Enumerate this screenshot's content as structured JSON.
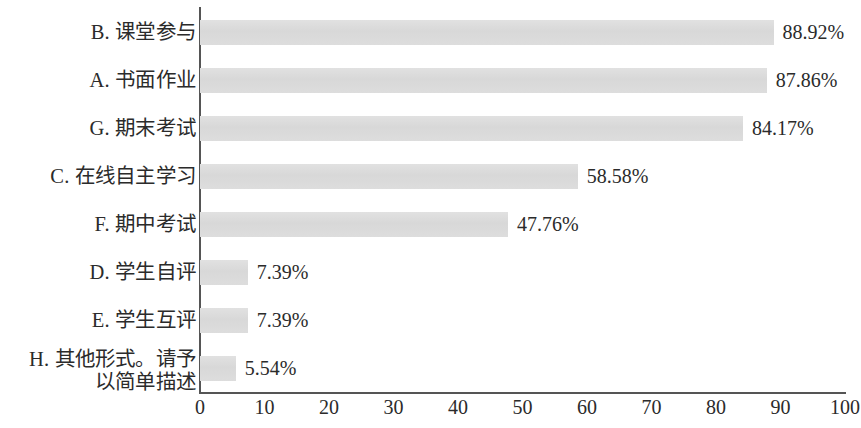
{
  "chart_data": {
    "type": "bar",
    "orientation": "horizontal",
    "title": "",
    "subtitle": "",
    "xlabel": "",
    "ylabel": "",
    "xlim": [
      0,
      100
    ],
    "xticks": [
      0,
      10,
      20,
      30,
      40,
      50,
      60,
      70,
      80,
      90,
      100
    ],
    "xtick_labels": [
      "0",
      "10",
      "20",
      "30",
      "40",
      "50",
      "60",
      "70",
      "80",
      "90",
      "100"
    ],
    "grid": false,
    "legend": false,
    "legend_position": "none",
    "bar_color": "#dcdcdc",
    "axis_color": "#555555",
    "text_color": "#2b2b2b",
    "value_label_suffix": "%",
    "categories": [
      "B. 课堂参与",
      "A. 书面作业",
      "G. 期末考试",
      "C. 在线自主学习",
      "F. 期中考试",
      "D. 学生自评",
      "E. 学生互评",
      "H. 其他形式。请予以简单描述"
    ],
    "values": [
      88.92,
      87.86,
      84.17,
      58.58,
      47.76,
      7.39,
      7.39,
      5.54
    ],
    "value_labels": [
      "88.92%",
      "87.86%",
      "84.17%",
      "58.58%",
      "47.76%",
      "7.39%",
      "7.39%",
      "5.54%"
    ],
    "bars": [
      {
        "category": "B. 课堂参与",
        "value": 88.92,
        "value_label": "88.92%",
        "label_lines": [
          "B. 课堂参与"
        ]
      },
      {
        "category": "A. 书面作业",
        "value": 87.86,
        "value_label": "87.86%",
        "label_lines": [
          "A. 书面作业"
        ]
      },
      {
        "category": "G. 期末考试",
        "value": 84.17,
        "value_label": "84.17%",
        "label_lines": [
          "G. 期末考试"
        ]
      },
      {
        "category": "C. 在线自主学习",
        "value": 58.58,
        "value_label": "58.58%",
        "label_lines": [
          "C. 在线自主学习"
        ]
      },
      {
        "category": "F. 期中考试",
        "value": 47.76,
        "value_label": "47.76%",
        "label_lines": [
          "F. 期中考试"
        ]
      },
      {
        "category": "D. 学生自评",
        "value": 7.39,
        "value_label": "7.39%",
        "label_lines": [
          "D. 学生自评"
        ]
      },
      {
        "category": "E. 学生互评",
        "value": 7.39,
        "value_label": "7.39%",
        "label_lines": [
          "E. 学生互评"
        ]
      },
      {
        "category": "H. 其他形式。请予以简单描述",
        "value": 5.54,
        "value_label": "5.54%",
        "label_lines": [
          "H. 其他形式。请予",
          "以简单描述"
        ]
      }
    ]
  }
}
